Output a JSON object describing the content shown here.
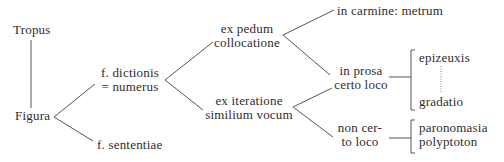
{
  "diagram": {
    "nodes": {
      "tropus": "Tropus",
      "figura": "Figura",
      "f_dictionis": [
        "f. dictionis",
        "= numerus"
      ],
      "f_sententiae": "f. sententiae",
      "ex_pedum": [
        "ex pedum",
        "collocatione"
      ],
      "ex_iteratione": [
        "ex iteratione",
        "similium vocum"
      ],
      "in_carmine": "in carmine: metrum",
      "in_prosa": [
        "in prosa",
        "certo loco"
      ],
      "non_certo": [
        "non cer-",
        "to loco"
      ],
      "epizeuxis": "epizeuxis",
      "gradatio": "gradatio",
      "paronomasia": "paronomasia",
      "polyptoton": "polyptoton"
    },
    "edges": [
      [
        "Tropus",
        "Figura"
      ],
      [
        "Figura",
        "f. dictionis = numerus"
      ],
      [
        "Figura",
        "f. sententiae"
      ],
      [
        "f. dictionis = numerus",
        "ex pedum collocatione"
      ],
      [
        "f. dictionis = numerus",
        "ex iteratione similium vocum"
      ],
      [
        "ex pedum collocatione",
        "in carmine: metrum"
      ],
      [
        "ex pedum collocatione",
        "in prosa certo loco"
      ],
      [
        "ex iteratione similium vocum",
        "in prosa certo loco"
      ],
      [
        "ex iteratione similium vocum",
        "non certo loco"
      ],
      [
        "in prosa certo loco",
        "epizeuxis ... gradatio"
      ],
      [
        "non certo loco",
        "paronomasia, polyptoton"
      ]
    ],
    "colors": {
      "text": "#2e2e2e",
      "lines": "#555555",
      "background": "#ffffff"
    }
  }
}
